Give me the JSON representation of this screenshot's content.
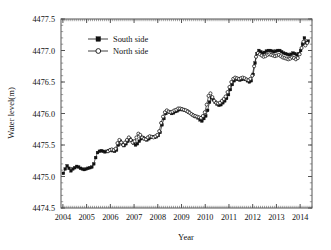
{
  "chart_data": {
    "type": "line",
    "title": "",
    "xlabel": "Year",
    "ylabel": "Water level(m)",
    "xlim": [
      2003.92,
      2014.5
    ],
    "ylim": [
      4474.5,
      4477.5
    ],
    "xticks": [
      2004,
      2005,
      2006,
      2007,
      2008,
      2009,
      2010,
      2011,
      2012,
      2013,
      2014
    ],
    "xtick_labels": [
      "2004",
      "2005",
      "2006",
      "2007",
      "2008",
      "2009",
      "2010",
      "2011",
      "2012",
      "2013",
      "2014"
    ],
    "yticks": [
      4474.5,
      4475.0,
      4475.5,
      4476.0,
      4476.5,
      4477.0,
      4477.5
    ],
    "ytick_labels": [
      "4474.5",
      "4475.0",
      "4475.5",
      "4476.0",
      "4476.5",
      "4477.0",
      "4477.5"
    ],
    "y_minor_step": 0.1,
    "x_minor_step": 0.0833,
    "grid": false,
    "legend_position": "upper-left-inside",
    "legend": [
      {
        "name": "South side",
        "marker": "filled-square",
        "color": "#111111"
      },
      {
        "name": "North side",
        "marker": "open-circle",
        "color": "#111111"
      }
    ],
    "series": [
      {
        "name": "South side",
        "marker": "filled-square",
        "color": "#111111",
        "x": [
          2004.02,
          2004.1,
          2004.18,
          2004.26,
          2004.34,
          2004.42,
          2004.5,
          2004.58,
          2004.66,
          2004.74,
          2004.82,
          2004.9,
          2004.98,
          2005.06,
          2005.14,
          2005.22,
          2005.3,
          2005.38,
          2005.46,
          2005.54,
          2005.62,
          2005.7,
          2005.78,
          2005.86,
          2005.94,
          2006.02,
          2006.1,
          2006.18,
          2006.26,
          2006.34,
          2006.42,
          2006.5,
          2006.58,
          2006.66,
          2006.74,
          2006.82,
          2006.9,
          2006.98,
          2007.06,
          2007.14,
          2007.22,
          2007.3,
          2007.38,
          2007.46,
          2007.54,
          2007.62,
          2007.7,
          2007.78,
          2007.86,
          2007.94,
          2008.02,
          2008.1,
          2008.18,
          2008.26,
          2008.34,
          2008.42,
          2008.5,
          2008.58,
          2008.66,
          2008.74,
          2008.82,
          2008.9,
          2008.98,
          2009.06,
          2009.14,
          2009.22,
          2009.3,
          2009.38,
          2009.46,
          2009.54,
          2009.62,
          2009.7,
          2009.78,
          2009.86,
          2009.94,
          2010.02,
          2010.1,
          2010.18,
          2010.26,
          2010.34,
          2010.42,
          2010.5,
          2010.58,
          2010.66,
          2010.74,
          2010.82,
          2010.9,
          2010.98,
          2011.06,
          2011.14,
          2011.22,
          2011.3,
          2011.38,
          2011.46,
          2011.54,
          2011.62,
          2011.7,
          2011.78,
          2011.86,
          2011.94,
          2012.02,
          2012.1,
          2012.18,
          2012.26,
          2012.34,
          2012.42,
          2012.5,
          2012.58,
          2012.66,
          2012.74,
          2012.82,
          2012.9,
          2012.98,
          2013.06,
          2013.14,
          2013.22,
          2013.3,
          2013.38,
          2013.46,
          2013.54,
          2013.62,
          2013.7,
          2013.78,
          2013.86,
          2013.94,
          2014.02,
          2014.1,
          2014.18,
          2014.26,
          2014.34
        ],
        "y": [
          4475.05,
          4475.12,
          4475.17,
          4475.13,
          4475.09,
          4475.12,
          4475.14,
          4475.16,
          4475.15,
          4475.13,
          4475.12,
          4475.11,
          4475.12,
          4475.13,
          4475.14,
          4475.15,
          4475.2,
          4475.3,
          4475.38,
          4475.4,
          4475.41,
          4475.4,
          4475.39,
          4475.4,
          4475.41,
          4475.42,
          4475.41,
          4475.4,
          4475.42,
          4475.5,
          4475.56,
          4475.52,
          4475.49,
          4475.52,
          4475.56,
          4475.6,
          4475.57,
          4475.53,
          4475.5,
          4475.52,
          4475.56,
          4475.6,
          4475.62,
          4475.6,
          4475.58,
          4475.6,
          4475.62,
          4475.63,
          4475.62,
          4475.63,
          4475.65,
          4475.7,
          4475.82,
          4475.92,
          4476.0,
          4476.03,
          4476.02,
          4476.0,
          4476.01,
          4476.03,
          4476.04,
          4476.06,
          4476.07,
          4476.06,
          4476.05,
          4476.04,
          4476.02,
          4476.0,
          4475.98,
          4475.96,
          4475.95,
          4475.93,
          4475.9,
          4475.88,
          4475.92,
          4475.96,
          4476.05,
          4476.18,
          4476.25,
          4476.22,
          4476.18,
          4476.15,
          4476.13,
          4476.14,
          4476.17,
          4476.2,
          4476.24,
          4476.3,
          4476.38,
          4476.46,
          4476.52,
          4476.55,
          4476.54,
          4476.53,
          4476.54,
          4476.55,
          4476.54,
          4476.52,
          4476.5,
          4476.52,
          4476.62,
          4476.8,
          4476.95,
          4477.0,
          4476.98,
          4476.96,
          4476.97,
          4476.99,
          4477.0,
          4477.0,
          4476.99,
          4476.98,
          4476.99,
          4477.0,
          4477.0,
          4476.98,
          4476.96,
          4476.95,
          4476.94,
          4476.93,
          4476.94,
          4476.96,
          4476.95,
          4476.93,
          4476.95,
          4477.0,
          4477.1,
          4477.2,
          4477.12,
          4477.15
        ]
      },
      {
        "name": "North side",
        "marker": "open-circle",
        "color": "#111111",
        "x": [
          2005.9,
          2005.98,
          2006.06,
          2006.14,
          2006.22,
          2006.3,
          2006.38,
          2006.46,
          2006.54,
          2006.62,
          2006.7,
          2006.78,
          2006.86,
          2006.94,
          2007.02,
          2007.1,
          2007.18,
          2007.26,
          2007.34,
          2007.42,
          2007.5,
          2007.58,
          2007.66,
          2007.74,
          2007.82,
          2007.9,
          2007.98,
          2008.06,
          2008.14,
          2008.22,
          2008.3,
          2008.38,
          2008.46,
          2008.54,
          2008.62,
          2008.7,
          2008.78,
          2008.86,
          2008.94,
          2009.02,
          2009.1,
          2009.18,
          2009.26,
          2009.34,
          2009.42,
          2009.5,
          2009.58,
          2009.66,
          2009.74,
          2009.82,
          2009.9,
          2009.98,
          2010.06,
          2010.14,
          2010.22,
          2010.3,
          2010.38,
          2010.46,
          2010.54,
          2010.62,
          2010.7,
          2010.78,
          2010.86,
          2010.94,
          2011.02,
          2011.1,
          2011.18,
          2011.26,
          2011.34,
          2011.42,
          2011.5,
          2011.58,
          2011.66,
          2011.74,
          2011.82,
          2011.9,
          2011.98,
          2012.06,
          2012.14,
          2012.22,
          2012.3,
          2012.38,
          2012.46,
          2012.54,
          2012.62,
          2012.7,
          2012.78,
          2012.86,
          2012.94,
          2013.02,
          2013.1,
          2013.18,
          2013.26,
          2013.34,
          2013.42,
          2013.5,
          2013.58,
          2013.66,
          2013.74,
          2013.82,
          2013.9,
          2013.98,
          2014.06,
          2014.14,
          2014.22,
          2014.3
        ],
        "y": [
          4475.4,
          4475.42,
          4475.43,
          4475.42,
          4475.44,
          4475.53,
          4475.58,
          4475.54,
          4475.5,
          4475.54,
          4475.58,
          4475.62,
          4475.58,
          4475.54,
          4475.56,
          4475.62,
          4475.68,
          4475.66,
          4475.62,
          4475.6,
          4475.59,
          4475.62,
          4475.64,
          4475.63,
          4475.62,
          4475.64,
          4475.66,
          4475.72,
          4475.85,
          4475.95,
          4476.02,
          4476.05,
          4476.03,
          4476.02,
          4476.03,
          4476.05,
          4476.06,
          4476.08,
          4476.08,
          4476.07,
          4476.06,
          4476.05,
          4476.03,
          4476.01,
          4475.99,
          4475.97,
          4475.96,
          4475.95,
          4475.94,
          4475.93,
          4475.96,
          4476.02,
          4476.14,
          4476.28,
          4476.32,
          4476.26,
          4476.2,
          4476.17,
          4476.16,
          4476.17,
          4476.2,
          4476.23,
          4476.27,
          4476.34,
          4476.42,
          4476.5,
          4476.55,
          4476.57,
          4476.56,
          4476.55,
          4476.56,
          4476.57,
          4476.56,
          4476.54,
          4476.53,
          4476.55,
          4476.6,
          4476.75,
          4476.9,
          4476.96,
          4476.94,
          4476.92,
          4476.9,
          4476.91,
          4476.93,
          4476.94,
          4476.93,
          4476.92,
          4476.91,
          4476.92,
          4476.93,
          4476.91,
          4476.89,
          4476.88,
          4476.87,
          4476.86,
          4476.87,
          4476.89,
          4476.88,
          4476.86,
          4476.88,
          4476.94,
          4477.04,
          4477.14,
          4477.08,
          4477.12
        ]
      }
    ]
  }
}
